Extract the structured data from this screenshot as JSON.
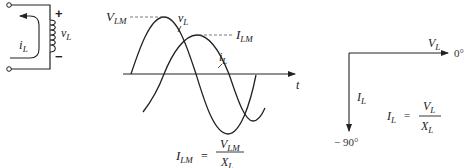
{
  "circuit": {
    "current_label": "i",
    "current_sub": "L",
    "voltage_label": "v",
    "voltage_sub": "L",
    "plus_sign": "+",
    "minus_sign": "−"
  },
  "waveform": {
    "peak_voltage_label": "V",
    "peak_voltage_sub": "LM",
    "peak_current_label": "I",
    "peak_current_sub": "LM",
    "voltage_curve_label": "v",
    "voltage_curve_sub": "L",
    "current_curve_label": "i",
    "current_curve_sub": "L",
    "time_axis_label": "t",
    "formula": {
      "lhs": "I",
      "lhs_sub": "LM",
      "equals": "=",
      "num": "V",
      "num_sub": "LM",
      "den": "X",
      "den_sub": "L"
    }
  },
  "phasor": {
    "voltage_label": "V",
    "voltage_sub": "L",
    "voltage_angle": "0°",
    "current_label": "I",
    "current_sub": "L",
    "current_angle": "− 90°",
    "formula": {
      "lhs": "I",
      "lhs_sub": "L",
      "equals": "=",
      "num": "V",
      "num_sub": "L",
      "den": "X",
      "den_sub": "L"
    }
  },
  "colors": {
    "ink": "#222222",
    "dashed": "#555555",
    "background": "#ffffff"
  }
}
